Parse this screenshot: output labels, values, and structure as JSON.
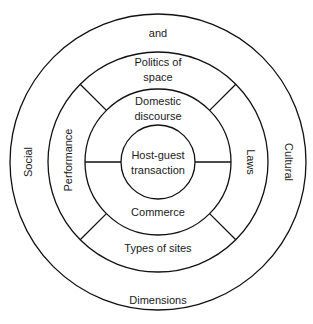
{
  "diagram": {
    "type": "concentric-rings",
    "center": {
      "x": 158,
      "y": 162
    },
    "colors": {
      "stroke": "#111111",
      "text": "#1a1a1a",
      "background": "#ffffff"
    },
    "rings": [
      {
        "name": "outer",
        "radius": 148
      },
      {
        "name": "middle",
        "radius": 110
      },
      {
        "name": "inner",
        "radius": 73
      },
      {
        "name": "core",
        "radius": 37
      }
    ],
    "labels": {
      "outer_top": "and",
      "outer_left": "Social",
      "outer_right": "Cultural",
      "outer_bottom": "Dimensions",
      "middle_top_line1": "Politics of",
      "middle_top_line2": "space",
      "middle_left": "Performance",
      "middle_right": "Laws",
      "middle_bottom": "Types of sites",
      "inner_top_line1": "Domestic",
      "inner_top_line2": "discourse",
      "inner_bottom": "Commerce",
      "core_line1": "Host-guest",
      "core_line2": "transaction"
    }
  }
}
